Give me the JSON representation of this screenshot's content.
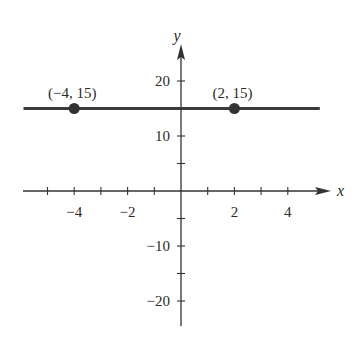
{
  "chart_data": {
    "type": "line",
    "title": "",
    "xlabel": "x",
    "ylabel": "y",
    "xlim": [
      -5.5,
      5.2
    ],
    "ylim": [
      -25,
      26
    ],
    "x_ticks": [
      -5,
      -4,
      -3,
      -2,
      -1,
      1,
      2,
      3,
      4
    ],
    "x_tick_labels": [
      {
        "value": -4,
        "label": "−4"
      },
      {
        "value": -2,
        "label": "−2"
      },
      {
        "value": 2,
        "label": "2"
      },
      {
        "value": 4,
        "label": "4"
      }
    ],
    "y_ticks": [
      -20,
      -15,
      -10,
      -5,
      5,
      10,
      15,
      20
    ],
    "y_tick_labels": [
      {
        "value": 20,
        "label": "20"
      },
      {
        "value": 10,
        "label": "10"
      },
      {
        "value": -10,
        "label": "−10"
      },
      {
        "value": -20,
        "label": "−20"
      }
    ],
    "series": [
      {
        "name": "y = 15",
        "x": [
          -5.9,
          5.2
        ],
        "y": [
          15,
          15
        ],
        "color": "#3a3a3a"
      }
    ],
    "points": [
      {
        "x": -4,
        "y": 15,
        "label": "(−4, 15)"
      },
      {
        "x": 2,
        "y": 15,
        "label": "(2, 15)"
      }
    ],
    "grid": false,
    "legend": "none"
  }
}
